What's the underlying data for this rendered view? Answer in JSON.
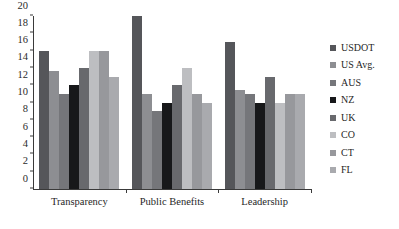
{
  "chart_data": {
    "type": "bar",
    "title": "",
    "subtitle": "",
    "xlabel": "",
    "ylabel": "",
    "ylim": [
      0,
      20
    ],
    "ytick_step": 2,
    "yticks": [
      0,
      2,
      4,
      6,
      8,
      10,
      12,
      14,
      16,
      18,
      20
    ],
    "grid": false,
    "legend_position": "right",
    "categories": [
      "Transparency",
      "Public Benefits",
      "Leadership"
    ],
    "series": [
      {
        "name": "USDOT",
        "color": "#55565a",
        "values": [
          16,
          20,
          17
        ]
      },
      {
        "name": "US Avg.",
        "color": "#8d8e92",
        "values": [
          13.7,
          11,
          11.5
        ]
      },
      {
        "name": "AUS",
        "color": "#75767a",
        "values": [
          11,
          9,
          11
        ]
      },
      {
        "name": "NZ",
        "color": "#17181a",
        "values": [
          12,
          10,
          10
        ]
      },
      {
        "name": "UK",
        "color": "#68696d",
        "values": [
          14,
          12,
          13
        ]
      },
      {
        "name": "CO",
        "color": "#bdbec1",
        "values": [
          16,
          14,
          10
        ]
      },
      {
        "name": "CT",
        "color": "#97989c",
        "values": [
          16,
          11,
          11
        ]
      },
      {
        "name": "FL",
        "color": "#a9aaae",
        "values": [
          13,
          10,
          11
        ]
      }
    ]
  },
  "legend": {
    "items": [
      {
        "label": "USDOT"
      },
      {
        "label": "US Avg."
      },
      {
        "label": "AUS"
      },
      {
        "label": "NZ"
      },
      {
        "label": "UK"
      },
      {
        "label": "CO"
      },
      {
        "label": "CT"
      },
      {
        "label": "FL"
      }
    ]
  }
}
